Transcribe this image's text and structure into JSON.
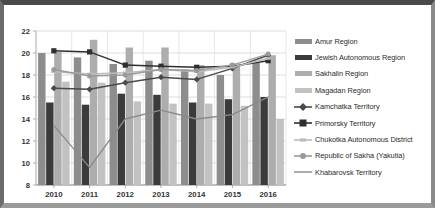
{
  "chart_data": {
    "type": "bar",
    "title": "",
    "subtitle": "",
    "xlabel": "",
    "ylabel": "",
    "ylim": [
      8,
      22
    ],
    "ytick_step": 2,
    "yticks": [
      "8",
      "10",
      "12",
      "14",
      "16",
      "18",
      "20",
      "22"
    ],
    "categories": [
      "2010",
      "2011",
      "2012",
      "2013",
      "2014",
      "2015",
      "2016"
    ],
    "grid": true,
    "legend_position": "right",
    "series": [
      {
        "name": "Amur Region",
        "kind": "bar",
        "color": "#8d8d8d",
        "values": [
          20.0,
          19.6,
          19.0,
          19.3,
          18.5,
          18.0,
          19.1
        ]
      },
      {
        "name": "Jewish Autonomous Region",
        "kind": "bar",
        "color": "#3b3b3b",
        "values": [
          15.5,
          15.3,
          16.3,
          16.2,
          15.5,
          15.8,
          16.0
        ]
      },
      {
        "name": "Sakhalin Region",
        "kind": "bar",
        "color": "#adadad",
        "values": [
          20.1,
          21.2,
          20.5,
          20.5,
          18.9,
          18.9,
          19.8
        ]
      },
      {
        "name": "Magadan Region",
        "kind": "bar",
        "color": "#c2c2c2",
        "values": [
          17.4,
          17.3,
          15.6,
          15.4,
          15.4,
          15.2,
          14.0
        ]
      },
      {
        "name": "Kamchatka Territory",
        "kind": "line",
        "color": "#4a4a4a",
        "marker": "diamond",
        "values": [
          16.8,
          16.7,
          17.3,
          17.8,
          17.6,
          18.6,
          19.8
        ]
      },
      {
        "name": "Primorsky Territory",
        "kind": "line",
        "color": "#2f2f2f",
        "marker": "square",
        "values": [
          20.2,
          20.1,
          18.9,
          18.8,
          18.7,
          18.8,
          19.3
        ]
      },
      {
        "name": "Chukotka Autonomous District",
        "kind": "line",
        "color": "#bcbcbc",
        "marker": "dash",
        "values": [
          18.3,
          18.1,
          18.2,
          18.5,
          18.3,
          18.7,
          19.5
        ]
      },
      {
        "name": "Republic of Sakha (Yakutia)",
        "kind": "line",
        "color": "#9a9a9a",
        "marker": "circle",
        "values": [
          18.5,
          17.9,
          18.0,
          18.5,
          18.4,
          18.9,
          19.9
        ]
      },
      {
        "name": "Khabarovsk Territory",
        "kind": "line",
        "color": "#8a8a8a",
        "marker": "none",
        "values": [
          13.4,
          9.6,
          14.0,
          14.8,
          14.0,
          14.4,
          16.0
        ]
      }
    ]
  },
  "legend": {
    "items": [
      {
        "label": "Amur Region",
        "key": "bar",
        "color": "#8d8d8d"
      },
      {
        "label": "Jewish Autonomous Region",
        "key": "bar",
        "color": "#3b3b3b"
      },
      {
        "label": "Sakhalin Region",
        "key": "bar",
        "color": "#adadad"
      },
      {
        "label": "Magadan Region",
        "key": "bar",
        "color": "#c2c2c2"
      },
      {
        "label": "Kamchatka Territory",
        "key": "line-diamond",
        "color": "#4a4a4a"
      },
      {
        "label": "Primorsky Territory",
        "key": "line-square",
        "color": "#2f2f2f"
      },
      {
        "label": "Chukotka Autonomous District",
        "key": "line-dash",
        "color": "#bcbcbc"
      },
      {
        "label": "Republic of Sakha (Yakutia)",
        "key": "line-circle",
        "color": "#9a9a9a"
      },
      {
        "label": "Khabarovsk Territory",
        "key": "line-plain",
        "color": "#8a8a8a"
      }
    ]
  }
}
